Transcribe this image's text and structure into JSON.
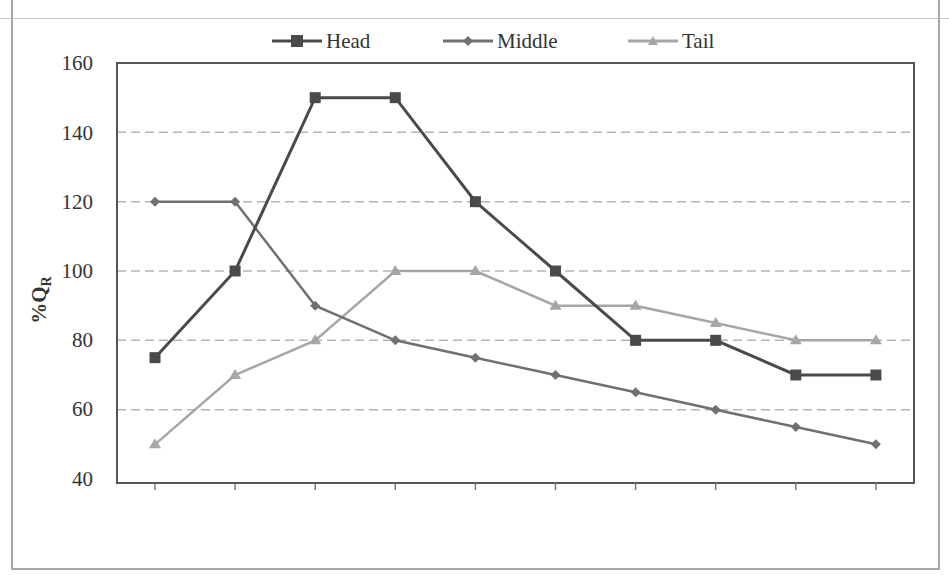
{
  "chart_data": {
    "type": "line",
    "title": "",
    "xlabel": "",
    "ylabel": "%Q",
    "ylabel_subscript": "R",
    "ylim": [
      40,
      160
    ],
    "yticks": [
      40,
      60,
      80,
      100,
      120,
      140,
      160
    ],
    "grid": "horizontal dashed",
    "legend_position": "top",
    "x": [
      1,
      2,
      3,
      4,
      5,
      6,
      7,
      8,
      9,
      10
    ],
    "series": [
      {
        "name": "Head",
        "marker": "square",
        "color": "#4a4a4a",
        "values": [
          75,
          100,
          150,
          150,
          120,
          100,
          80,
          80,
          70,
          70
        ]
      },
      {
        "name": "Middle",
        "marker": "diamond",
        "color": "#707070",
        "values": [
          120,
          120,
          90,
          80,
          75,
          70,
          65,
          60,
          55,
          50
        ]
      },
      {
        "name": "Tail",
        "marker": "triangle",
        "color": "#a6a6a6",
        "values": [
          50,
          70,
          80,
          100,
          100,
          90,
          90,
          85,
          80,
          80
        ]
      }
    ]
  },
  "legend": {
    "items": [
      {
        "label": "Head"
      },
      {
        "label": "Middle"
      },
      {
        "label": "Tail"
      }
    ]
  },
  "axis": {
    "y_title": "%Q",
    "y_title_sub": "R",
    "y_ticks": [
      "160",
      "140",
      "120",
      "100",
      "80",
      "60",
      "40"
    ]
  }
}
